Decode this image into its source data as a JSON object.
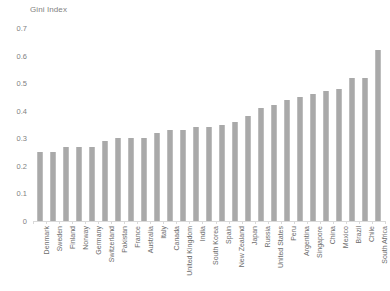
{
  "chart_data": {
    "type": "bar",
    "title": "Gini Index",
    "xlabel": "",
    "ylabel": "",
    "ylim": [
      0,
      0.7
    ],
    "yticks": [
      "0",
      "0.1",
      "0.2",
      "0.3",
      "0.4",
      "0.5",
      "0.6",
      "0.7"
    ],
    "ytick_values": [
      0,
      0.1,
      0.2,
      0.3,
      0.4,
      0.5,
      0.6,
      0.7
    ],
    "grid": false,
    "legend": false,
    "bar_color": "#a9a9a9",
    "categories": [
      "Denmark",
      "Sweden",
      "Finland",
      "Norway",
      "Germany",
      "Switzerland",
      "Pakistan",
      "France",
      "Australia",
      "Italy",
      "Canada",
      "United Kingdom",
      "India",
      "South Korea",
      "Spain",
      "New Zealand",
      "Japan",
      "Russia",
      "United States",
      "Peru",
      "Argentina",
      "Singapore",
      "China",
      "Mexico",
      "Brazil",
      "Chile",
      "South Africa"
    ],
    "values": [
      0.25,
      0.25,
      0.27,
      0.27,
      0.27,
      0.29,
      0.3,
      0.3,
      0.3,
      0.32,
      0.33,
      0.33,
      0.34,
      0.34,
      0.35,
      0.36,
      0.38,
      0.41,
      0.42,
      0.44,
      0.45,
      0.46,
      0.47,
      0.48,
      0.52,
      0.52,
      0.62
    ]
  }
}
